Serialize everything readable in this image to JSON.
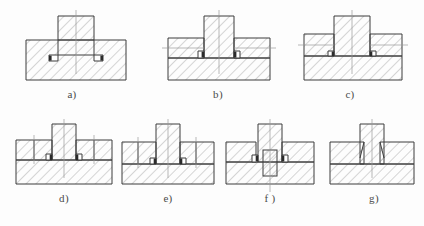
{
  "figure": {
    "kind": "engineering-cross-section-plate",
    "background_color": "#fdfdfd",
    "line_color": "#3c3c3c",
    "hatch_color": "#7a7a7a",
    "centerline_color": "#8a8a8a",
    "key_fill_color": "#2b2b2b",
    "rows": 2,
    "columns_top": 3,
    "columns_bottom": 4,
    "total_subfigures": 7
  },
  "subfigures": [
    {
      "id": "a",
      "label": "a)",
      "row": 1,
      "column": 1,
      "description": "Rectangular base block with central raised boss; two small dark keys seated in shallow recesses at the boss root on both sides",
      "base_hatch_direction": "right",
      "boss_hatch_direction": "right",
      "has_vertical_centerline": true,
      "has_horizontal_centerline": false,
      "key_count": 2,
      "has_pin": false,
      "side_blocks": 0
    },
    {
      "id": "b",
      "label": "b)",
      "row": 1,
      "column": 2,
      "description": "Base block with central boss flanked by two side segments; horizontal parting line across full width with small dark keys at the boss corners",
      "base_hatch_direction": "right",
      "boss_hatch_direction": "right",
      "has_vertical_centerline": true,
      "has_horizontal_centerline": true,
      "key_count": 2,
      "has_pin": false,
      "side_blocks": 2
    },
    {
      "id": "c",
      "label": "c)",
      "row": 1,
      "column": 3,
      "description": "Base block with tall central boss extending down into a seated pocket; side blocks on both flanks with an interrupted parting line and keys under the boss",
      "base_hatch_direction": "right",
      "boss_hatch_direction": "right",
      "has_vertical_centerline": true,
      "has_horizontal_centerline": true,
      "key_count": 2,
      "has_pin": false,
      "side_blocks": 2
    },
    {
      "id": "d",
      "label": "d)",
      "row": 2,
      "column": 1,
      "description": "Base block with central boss; two stepped side blocks on each flank with vertical division lines and small keys at the step corners",
      "base_hatch_direction": "right",
      "boss_hatch_direction": "right",
      "has_vertical_centerline": true,
      "has_horizontal_centerline": true,
      "key_count": 2,
      "has_pin": false,
      "side_blocks": 4
    },
    {
      "id": "e",
      "label": "e)",
      "row": 2,
      "column": 2,
      "description": "Base block with central boss seated deeper; stepped side blocks on each flank, keys set at the lower boss corners",
      "base_hatch_direction": "right",
      "boss_hatch_direction": "right",
      "has_vertical_centerline": true,
      "has_horizontal_centerline": true,
      "key_count": 2,
      "has_pin": false,
      "side_blocks": 4
    },
    {
      "id": "f",
      "label": "f )",
      "row": 2,
      "column": 3,
      "description": "Base block with narrow central boss located by a vertical cylindrical pin passing through the parting plane; keys on both sides of the boss",
      "base_hatch_direction": "right",
      "boss_hatch_direction": "right",
      "has_vertical_centerline": true,
      "has_horizontal_centerline": true,
      "key_count": 2,
      "has_pin": true,
      "pin_hatch_direction": "right",
      "side_blocks": 2
    },
    {
      "id": "g",
      "label": "g)",
      "row": 2,
      "column": 4,
      "description": "Base block with central boss blending into the base through tapered fillets; plain horizontal parting line, no keys",
      "base_hatch_direction": "right",
      "boss_hatch_direction": "right",
      "has_vertical_centerline": true,
      "has_horizontal_centerline": true,
      "key_count": 0,
      "has_pin": false,
      "side_blocks": 2
    }
  ]
}
